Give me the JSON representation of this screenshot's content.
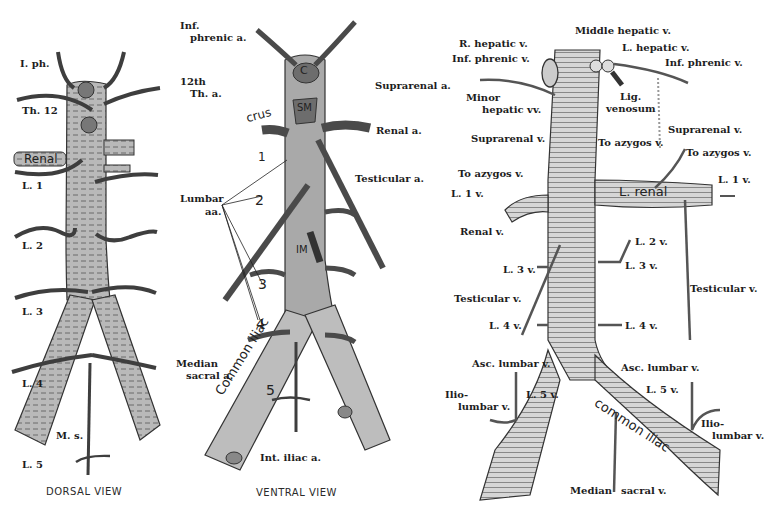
{
  "colors": {
    "vessel_fill": "#b8b8b8",
    "vessel_stroke": "#333333",
    "branch": "#3e3e3e",
    "background": "#ffffff",
    "ink": "#1d1d1d"
  },
  "dorsal": {
    "caption": "DORSAL VIEW",
    "labels": {
      "iph": "I. ph.",
      "th12": "Th. 12",
      "renal": "Renal",
      "l1": "L. 1",
      "l2": "L. 2",
      "l3": "L. 3",
      "l4": "L. 4",
      "ms": "M. s.",
      "l5": "L. 5"
    }
  },
  "ventral": {
    "caption": "VENTRAL VIEW",
    "labels": {
      "inf_phrenic_1": "Inf.",
      "inf_phrenic_2": "phrenic a.",
      "th12_1": "12th",
      "th12_2": "Th. a.",
      "crus": "crus",
      "c": "C",
      "sm": "SM",
      "im": "IM",
      "suprarenal": "Suprarenal a.",
      "renal": "Renal a.",
      "testicular": "Testicular a.",
      "lumbar_1": "Lumbar",
      "lumbar_2": "aa.",
      "n1": "1",
      "n2": "2",
      "n3": "3",
      "n4": "4",
      "n5": "5",
      "common_iliac": "Common iliac",
      "median_sacral_1": "Median",
      "median_sacral_2": "sacral a.",
      "int_iliac": "Int. iliac a."
    }
  },
  "vein": {
    "labels": {
      "middle_hepatic": "Middle hepatic v.",
      "r_hepatic": "R. hepatic v.",
      "l_hepatic": "L. hepatic v.",
      "inf_phrenic_l": "Inf. phrenic v.",
      "inf_phrenic_r": "Inf. phrenic v.",
      "minor_hepatic_1": "Minor",
      "minor_hepatic_2": "hepatic vv.",
      "lig_1": "Lig.",
      "lig_2": "venosum",
      "suprarenal_l": "Suprarenal v.",
      "suprarenal_r": "Suprarenal v.",
      "to_azygos_l": "To azygos v.",
      "to_azygos_m": "To azygos v.",
      "to_azygos_r": "To azygos v.",
      "l1v_l": "L. 1 v.",
      "l1v_r": "L. 1 v.",
      "l_renal": "L. renal",
      "renal_v": "Renal v.",
      "l2v": "L. 2 v.",
      "l3v_l": "L. 3 v.",
      "l3v_r": "L. 3 v.",
      "testicular_l": "Testicular v.",
      "testicular_r": "Testicular v.",
      "l4v_l": "L. 4 v.",
      "l4v_r": "L. 4 v.",
      "asc_lumbar_l": "Asc. lumbar v.",
      "asc_lumbar_r": "Asc. lumbar v.",
      "ilio_l_1": "Ilio-",
      "ilio_l_2": "lumbar v.",
      "ilio_r_1": "Ilio-",
      "ilio_r_2": "lumbar v.",
      "l5v_l": "L. 5 v.",
      "l5v_r": "L. 5 v.",
      "common_iliac": "common iliac",
      "median": "Median",
      "sacral": "sacral v."
    }
  }
}
